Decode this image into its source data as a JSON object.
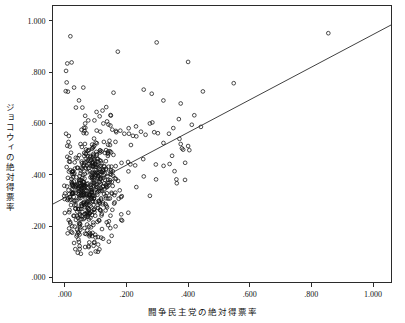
{
  "chart_data": {
    "type": "scatter",
    "title": "",
    "subtitle": "",
    "xlabel": "闘争民主党の絶対得票率",
    "ylabel": "ジョコウィの絶対得票率",
    "xlim": [
      -0.04,
      1.06
    ],
    "ylim": [
      -0.02,
      1.06
    ],
    "xticks": [
      0.0,
      0.2,
      0.4,
      0.6,
      0.8,
      1.0
    ],
    "xtick_labels": [
      ".000",
      ".200",
      ".400",
      ".600",
      ".800",
      "1.000"
    ],
    "yticks": [
      0.0,
      0.2,
      0.4,
      0.6,
      0.8,
      1.0
    ],
    "ytick_labels": [
      ".000",
      ".200",
      ".400",
      ".600",
      ".800",
      "1.000"
    ],
    "grid": false,
    "legend": "none",
    "marker": "open-circle",
    "marker_color": "#111111",
    "fit_line": {
      "type": "linear-regression",
      "x_start": -0.04,
      "y_start": 0.285,
      "x_end": 1.06,
      "y_end": 0.985,
      "slope": 0.636,
      "intercept": 0.31,
      "color": "#2b2b2b"
    },
    "n_points": 612,
    "points": [
      [
        0.018,
        0.94
      ],
      [
        0.008,
        0.834
      ],
      [
        0.022,
        0.838
      ],
      [
        0.004,
        0.805
      ],
      [
        0.006,
        0.76
      ],
      [
        0.003,
        0.726
      ],
      [
        0.01,
        0.724
      ],
      [
        0.03,
        0.74
      ],
      [
        0.06,
        0.74
      ],
      [
        0.046,
        0.69
      ],
      [
        0.036,
        0.662
      ],
      [
        0.057,
        0.662
      ],
      [
        0.172,
        0.88
      ],
      [
        0.298,
        0.916
      ],
      [
        0.158,
        0.72
      ],
      [
        0.256,
        0.732
      ],
      [
        0.282,
        0.716
      ],
      [
        0.4,
        0.84
      ],
      [
        0.376,
        0.678
      ],
      [
        0.448,
        0.725
      ],
      [
        0.548,
        0.757
      ],
      [
        0.855,
        0.952
      ],
      [
        0.066,
        0.63
      ],
      [
        0.076,
        0.612
      ],
      [
        0.066,
        0.6
      ],
      [
        0.062,
        0.583
      ],
      [
        0.064,
        0.57
      ],
      [
        0.103,
        0.645
      ],
      [
        0.096,
        0.612
      ],
      [
        0.113,
        0.628
      ],
      [
        0.125,
        0.6
      ],
      [
        0.137,
        0.608
      ],
      [
        0.148,
        0.592
      ],
      [
        0.154,
        0.576
      ],
      [
        0.167,
        0.566
      ],
      [
        0.18,
        0.572
      ],
      [
        0.193,
        0.56
      ],
      [
        0.208,
        0.56
      ],
      [
        0.221,
        0.552
      ],
      [
        0.232,
        0.55
      ],
      [
        0.247,
        0.568
      ],
      [
        0.262,
        0.556
      ],
      [
        0.276,
        0.6
      ],
      [
        0.284,
        0.604
      ],
      [
        0.29,
        0.566
      ],
      [
        0.302,
        0.562
      ],
      [
        0.32,
        0.524
      ],
      [
        0.338,
        0.56
      ],
      [
        0.352,
        0.582
      ],
      [
        0.37,
        0.617
      ],
      [
        0.372,
        0.54
      ],
      [
        0.376,
        0.52
      ],
      [
        0.38,
        0.503
      ],
      [
        0.384,
        0.498
      ],
      [
        0.4,
        0.512
      ],
      [
        0.404,
        0.496
      ],
      [
        0.412,
        0.595
      ],
      [
        0.348,
        0.474
      ],
      [
        0.34,
        0.442
      ],
      [
        0.356,
        0.414
      ],
      [
        0.362,
        0.382
      ],
      [
        0.39,
        0.38
      ],
      [
        0.296,
        0.382
      ],
      [
        0.276,
        0.318
      ],
      [
        0.232,
        0.352
      ],
      [
        0.206,
        0.252
      ],
      [
        0.152,
        0.162
      ],
      [
        0.118,
        0.155
      ],
      [
        0.004,
        0.56
      ],
      [
        0.012,
        0.528
      ],
      [
        0.016,
        0.51
      ],
      [
        0.02,
        0.486
      ],
      [
        0.008,
        0.47
      ],
      [
        0.014,
        0.452
      ],
      [
        0.006,
        0.43
      ],
      [
        0.018,
        0.418
      ],
      [
        0.024,
        0.402
      ],
      [
        0.01,
        0.388
      ],
      [
        0.022,
        0.372
      ],
      [
        0.028,
        0.356
      ],
      [
        0.012,
        0.34
      ],
      [
        0.026,
        0.326
      ],
      [
        0.016,
        0.312
      ],
      [
        0.03,
        0.298
      ],
      [
        0.02,
        0.282
      ],
      [
        0.034,
        0.268
      ],
      [
        0.014,
        0.254
      ],
      [
        0.028,
        0.24
      ],
      [
        0.036,
        0.224
      ],
      [
        0.018,
        0.21
      ],
      [
        0.032,
        0.198
      ],
      [
        0.04,
        0.186
      ],
      [
        0.024,
        0.174
      ],
      [
        0.038,
        0.16
      ],
      [
        0.044,
        0.148
      ],
      [
        0.03,
        0.134
      ],
      [
        0.048,
        0.122
      ],
      [
        0.034,
        0.11
      ],
      [
        0.042,
        0.096
      ],
      [
        0.052,
        0.092
      ]
    ],
    "note": "Dense central cluster approx x in [0.00,0.22], y in [0.10,0.62]; sparse positively-sloped tail to upper right."
  },
  "figure": {
    "background": "#ffffff",
    "frame_color": "#2b2b2b"
  }
}
